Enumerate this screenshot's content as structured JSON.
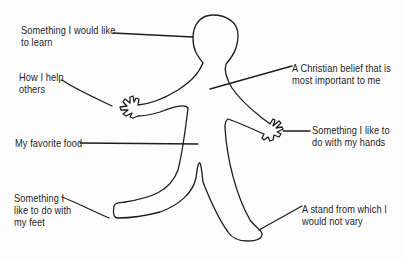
{
  "diagram": {
    "type": "labeled-figure",
    "figure": "gingerbread-style human outline",
    "line_color": "#1e1e1e",
    "background": "#fdfdfd"
  },
  "labels": {
    "learn": {
      "lines": [
        "Something I would like",
        "to learn"
      ],
      "points_to": "head"
    },
    "help": {
      "lines": [
        "How I help",
        "others"
      ],
      "points_to": "left hand"
    },
    "belief": {
      "lines": [
        "A Christian belief that is",
        "most important to me"
      ],
      "points_to": "chest / heart"
    },
    "hands": {
      "lines": [
        "Something I like to",
        "do with my hands"
      ],
      "points_to": "right hand"
    },
    "food": {
      "lines": [
        "My favorite food"
      ],
      "points_to": "stomach"
    },
    "feet": {
      "lines": [
        "Something I",
        "like to do with",
        "my feet"
      ],
      "points_to": "left foot"
    },
    "stand": {
      "lines": [
        "A stand from which I",
        "would not vary"
      ],
      "points_to": "right foot"
    }
  }
}
